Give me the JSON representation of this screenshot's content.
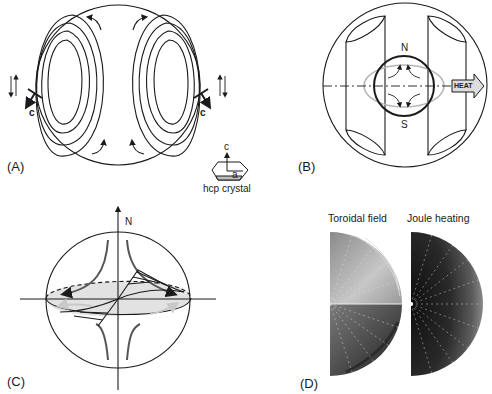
{
  "figure": {
    "panels": [
      {
        "id": "A",
        "label": "(A)",
        "axis_label_left": "c",
        "axis_label_right": "c",
        "crystal_caption": "hcp crystal",
        "crystal_axis_c": "c",
        "crystal_axis_a": "a"
      },
      {
        "id": "B",
        "label": "(B)",
        "pole_north": "N",
        "pole_south": "S",
        "arrow_text": "HEAT"
      },
      {
        "id": "C",
        "label": "(C)",
        "pole_north": "N"
      },
      {
        "id": "D",
        "label": "(D)",
        "titles": [
          "Toroidal field",
          "Joule heating"
        ]
      }
    ],
    "colors": {
      "line": "#1a1a1a",
      "gray_line": "#b0b0b0",
      "shade": "#e2e2e2",
      "heat_fill": "#dcdcdc"
    }
  }
}
